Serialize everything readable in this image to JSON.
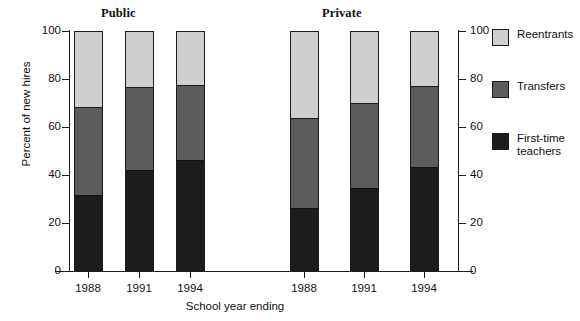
{
  "chart_data": {
    "type": "bar",
    "stacked": true,
    "title": "",
    "xlabel": "School year ending",
    "ylabel": "Percent of new hires",
    "ylim": [
      0,
      100
    ],
    "yticks": [
      0,
      20,
      40,
      60,
      80,
      100
    ],
    "right_axis_yticks": [
      0,
      20,
      40,
      60,
      80,
      100
    ],
    "grid": false,
    "legend_position": "right",
    "groups": [
      {
        "name": "Public",
        "categories": [
          "1988",
          "1991",
          "1994"
        ]
      },
      {
        "name": "Private",
        "categories": [
          "1988",
          "1991",
          "1994"
        ]
      }
    ],
    "categories": [
      "1988",
      "1991",
      "1994",
      "1988",
      "1991",
      "1994"
    ],
    "series": [
      {
        "name": "First-time teachers",
        "color": "#1c1c1c",
        "values": [
          31.5,
          42.0,
          46.0,
          26.0,
          34.5,
          43.0
        ]
      },
      {
        "name": "Transfers",
        "color": "#5c5c5c",
        "values": [
          36.5,
          34.5,
          31.5,
          37.5,
          35.5,
          34.0
        ]
      },
      {
        "name": "Reentrants",
        "color": "#cfcfcf",
        "values": [
          32.0,
          23.5,
          22.5,
          36.5,
          30.0,
          23.0
        ]
      }
    ],
    "cumulative_tops": {
      "first_time_teachers": [
        31.5,
        42.0,
        46.0,
        26.0,
        34.5,
        43.0
      ],
      "transfers": [
        68.0,
        76.5,
        77.5,
        63.5,
        70.0,
        77.0
      ],
      "reentrants": [
        100,
        100,
        100,
        100,
        100,
        100
      ]
    }
  },
  "groupTitles": {
    "public": "Public",
    "private": "Private"
  },
  "axes": {
    "ylabel": "Percent of new hires",
    "xlabel": "School year ending",
    "yticks": [
      "100",
      "80",
      "60",
      "40",
      "20",
      "0"
    ],
    "yticksRight": [
      "100",
      "80",
      "60",
      "40",
      "20",
      "0"
    ],
    "xticks": [
      "1988",
      "1991",
      "1994",
      "1988",
      "1991",
      "1994"
    ]
  },
  "legend": {
    "items": [
      {
        "label": "Reentrants",
        "color": "#cfcfcf"
      },
      {
        "label": "Transfers",
        "color": "#5c5c5c"
      },
      {
        "label": "First-time\nteachers",
        "color": "#1c1c1c"
      }
    ]
  }
}
